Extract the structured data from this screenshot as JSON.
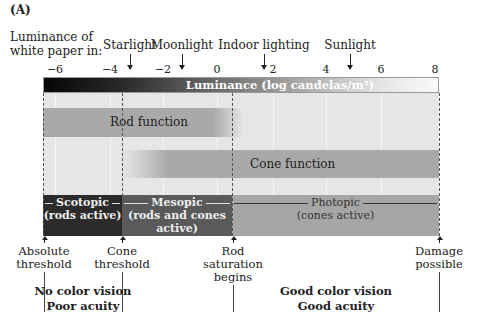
{
  "figure": {
    "panel_label": "(A)",
    "luminance_label_line1": "Luminance of",
    "luminance_label_line2": "white paper in:"
  },
  "light_sources": [
    {
      "label": "Starlight",
      "value": -3.3
    },
    {
      "label": "Moonlight",
      "value": -1.6
    },
    {
      "label": "Indoor lighting",
      "value": 1.8
    },
    {
      "label": "Sunlight",
      "value": 5.0
    }
  ],
  "axis": {
    "title": "Luminance (log candelas/m²)",
    "ticks": [
      "−6",
      "−4",
      "−2",
      "0",
      "2",
      "4",
      "6",
      "8"
    ],
    "range": [
      -6.4,
      8.1
    ]
  },
  "functions": {
    "rod": {
      "label": "Rod function",
      "start": -6.4,
      "end": 0.8
    },
    "cone": {
      "label": "Cone function",
      "start": -3.5,
      "end": 8.1
    }
  },
  "ranges": {
    "scotopic": {
      "title": "Scotopic",
      "subtitle": "(rods active)",
      "color": "#2b2b2b"
    },
    "mesopic": {
      "title": "Mesopic",
      "subtitle_line1": "(rods and cones",
      "subtitle_line2": "active)",
      "color": "#5a5a5a"
    },
    "photopic": {
      "title": "Photopic",
      "subtitle": "(cones active)",
      "color": "#a6a6a6"
    }
  },
  "thresholds": [
    {
      "line1": "Absolute",
      "line2": "threshold",
      "line3": ""
    },
    {
      "line1": "Cone",
      "line2": "threshold",
      "line3": ""
    },
    {
      "line1": "Rod",
      "line2": "saturation",
      "line3": "begins"
    },
    {
      "line1": "Damage",
      "line2": "possible",
      "line3": ""
    }
  ],
  "summaries": {
    "scotopic_line1": "No color vision",
    "scotopic_line2": "Poor acuity",
    "photopic_line1": "Good color vision",
    "photopic_line2": "Good acuity"
  }
}
